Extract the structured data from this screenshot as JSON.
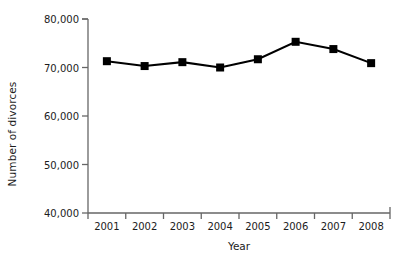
{
  "chart_data": {
    "type": "line",
    "title": "",
    "subtitle": "",
    "xlabel": "Year",
    "ylabel": "Number of divorces",
    "categories": [
      "2001",
      "2002",
      "2003",
      "2004",
      "2005",
      "2006",
      "2007",
      "2008"
    ],
    "values": [
      71300,
      70300,
      71100,
      70000,
      71700,
      75300,
      73800,
      70900
    ],
    "series": [
      {
        "name": "Number of divorces",
        "values": [
          71300,
          70300,
          71100,
          70000,
          71700,
          75300,
          73800,
          70900
        ]
      }
    ],
    "ylim": [
      40000,
      80000
    ],
    "ytick_values": [
      40000,
      50000,
      60000,
      70000,
      80000
    ],
    "ytick_labels": [
      "40,000",
      "50,000",
      "60,000",
      "70,000",
      "80,000"
    ],
    "xtick_labels": [
      "2001",
      "2002",
      "2003",
      "2004",
      "2005",
      "2006",
      "2007",
      "2008"
    ],
    "grid": false,
    "legend": false,
    "legend_position": "none",
    "marker": "square",
    "line_color": "#000000",
    "marker_color": "#000000",
    "axis_color": "#555555",
    "background_color": "#ffffff",
    "annotations": []
  },
  "axes": {
    "y_title": "Number of divorces",
    "x_title": "Year"
  }
}
